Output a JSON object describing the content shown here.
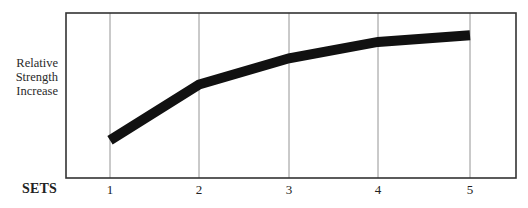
{
  "chart_data": {
    "type": "line",
    "title": "",
    "xlabel": "SETS",
    "ylabel": "Relative Strength Increase",
    "ylabel_lines": [
      "Relative",
      "Strength",
      "Increase"
    ],
    "x": [
      1,
      2,
      3,
      4,
      5
    ],
    "categories": [
      "1",
      "2",
      "3",
      "4",
      "5"
    ],
    "series": [
      {
        "name": "Relative Strength Increase",
        "values": [
          23,
          57,
          73,
          83,
          87
        ]
      }
    ],
    "ylim": [
      0,
      100
    ],
    "y_ticks_shown": false,
    "grid": "vertical lines at each set",
    "legend": "none",
    "line_color": "#111111",
    "frame_color": "#333333",
    "grid_color": "#888888"
  }
}
